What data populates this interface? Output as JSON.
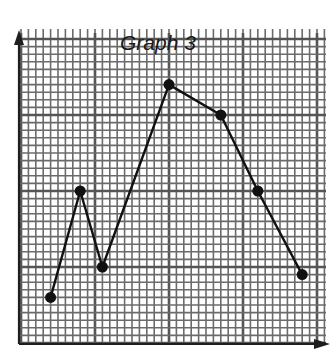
{
  "chart_data": {
    "type": "line",
    "title": "Graph 3",
    "xlabel": "",
    "ylabel": "",
    "grid": true,
    "legend": null,
    "xlim": [
      0,
      41
    ],
    "ylim": [
      0,
      41
    ],
    "grid_minor_step": 1,
    "grid_major_step": 10,
    "series": [
      {
        "name": "",
        "x": [
          4,
          8,
          11,
          20,
          27,
          32,
          38
        ],
        "y": [
          6,
          20,
          10,
          34,
          30,
          20,
          9
        ]
      }
    ]
  },
  "colors": {
    "line": "#111111",
    "grid_minor": "#6b6b6b",
    "grid_major": "#555555",
    "axis": "#1e1e1e",
    "background": "#ffffff"
  }
}
